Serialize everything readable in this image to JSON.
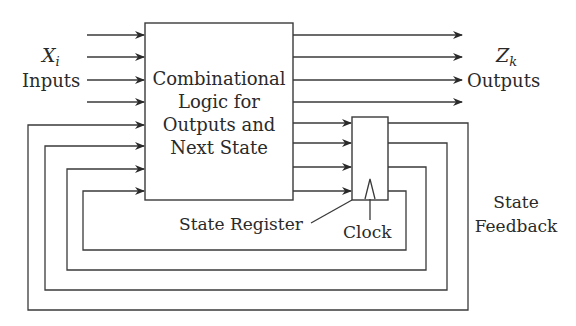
{
  "diagram": {
    "type": "block-diagram",
    "inputs": {
      "symbol": "X",
      "subscript": "i",
      "label": "Inputs",
      "count": 4
    },
    "outputs": {
      "symbol": "Z",
      "subscript": "k",
      "label": "Outputs",
      "count": 4
    },
    "combinational_block": {
      "lines": [
        "Combinational",
        "Logic for",
        "Outputs and",
        "Next State"
      ]
    },
    "state_register": {
      "label": "State Register",
      "clock_label": "Clock",
      "bits": 4
    },
    "feedback": {
      "lines": [
        "State",
        "Feedback"
      ],
      "count": 4
    },
    "colors": {
      "line": "#3a3a3a",
      "text": "#2a2a2a",
      "background": "#ffffff"
    }
  }
}
